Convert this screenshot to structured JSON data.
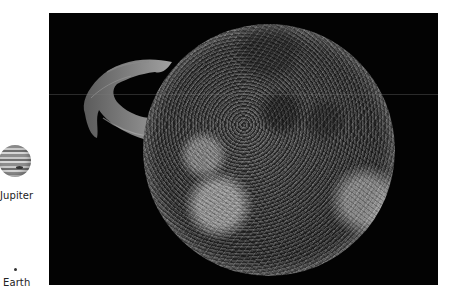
{
  "main_image": {
    "subject": "Sun with solar prominence",
    "background_color": "#030303"
  },
  "scale_legend": {
    "items": [
      {
        "label": "Jupiter",
        "icon": "jupiter-icon"
      },
      {
        "label": "Earth",
        "icon": "earth-dot-icon"
      }
    ]
  }
}
